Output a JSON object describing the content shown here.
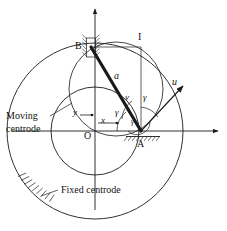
{
  "figure": {
    "type": "kinematics-diagram",
    "stroke_color": "#1a1a1a",
    "background_color": "#ffffff"
  },
  "labels": {
    "point_b": "B",
    "point_a": "A",
    "point_i": "I",
    "origin": "O",
    "axis_x": "x",
    "axis_y": "y",
    "bar_length": "a",
    "velocity": "v",
    "direction_u": "u",
    "angle_gamma_1": "γ",
    "angle_gamma_2": "γ",
    "angle_gamma_3": "γ",
    "moving_centrode_line1": "Moving",
    "moving_centrode_line2": "centrode",
    "fixed_centrode": "Fixed  centrode"
  },
  "geometry": {
    "fixed_centrode": {
      "cx": 95,
      "cy": 131,
      "r": 88
    },
    "moving_centrode": {
      "cx": 95,
      "cy": 131,
      "r": 44
    },
    "point_o": {
      "x": 95,
      "y": 131
    },
    "point_a": {
      "x": 141,
      "y": 131
    },
    "point_b": {
      "x": 91,
      "y": 47
    },
    "point_i": {
      "x": 141,
      "y": 47
    },
    "u_arrow_tip": {
      "x": 186,
      "y": 83
    },
    "x_axis_arrow_tip": {
      "x": 221,
      "y": 131
    },
    "y_axis_arrow_tip": {
      "x": 95,
      "y": 6
    }
  }
}
